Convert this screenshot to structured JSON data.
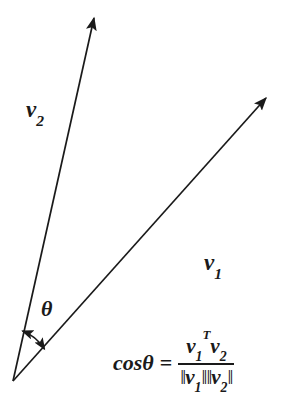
{
  "figure": {
    "type": "vector-diagram",
    "background_color": "#ffffff",
    "stroke_color": "#1a1a1a",
    "width": 303,
    "height": 416,
    "origin": {
      "x": 13,
      "y": 381
    },
    "vectors": [
      {
        "name": "v1",
        "label": "v",
        "subscript": "1",
        "tip": {
          "x": 268,
          "y": 96
        },
        "label_position": {
          "x": 204,
          "y": 251
        }
      },
      {
        "name": "v2",
        "label": "v",
        "subscript": "2",
        "tip": {
          "x": 95,
          "y": 15
        },
        "label_position": {
          "x": 26,
          "y": 98
        }
      }
    ],
    "angle": {
      "symbol": "θ",
      "label_position": {
        "x": 41,
        "y": 298
      },
      "arc_arrow": "double-headed",
      "arc_start": {
        "x": 22,
        "y": 330
      },
      "arc_end": {
        "x": 44,
        "y": 349
      }
    }
  },
  "formula": {
    "lhs": "cosθ",
    "equals": "=",
    "numerator": {
      "term1_base": "v",
      "term1_sub": "1",
      "term1_sup": "T",
      "term2_base": "v",
      "term2_sub": "2"
    },
    "denominator": {
      "open1": "‖",
      "term1_base": "v",
      "term1_sub": "1",
      "close1": "‖",
      "open2": "‖",
      "term2_base": "v",
      "term2_sub": "2",
      "close2": "‖"
    },
    "plain_text": "cosθ = v₁ᵀv₂ / ‖v₁‖‖v₂‖"
  }
}
